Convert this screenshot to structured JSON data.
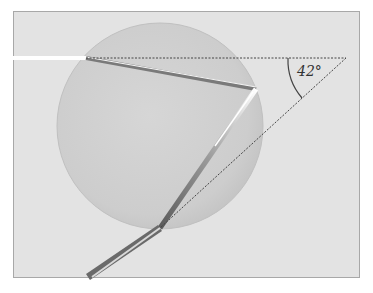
{
  "diagram": {
    "angle_label": "42°",
    "colors": {
      "background": "#ffffff",
      "frame_fill": "#e3e3e3",
      "frame_border": "#a8a8a8",
      "drop_fill": "#cfcfcf",
      "drop_edge": "#bdbdbd",
      "ray_light": "#ffffff",
      "ray_dark": "#6e6e6e",
      "dotted_line": "#444444",
      "arc": "#444444"
    }
  }
}
